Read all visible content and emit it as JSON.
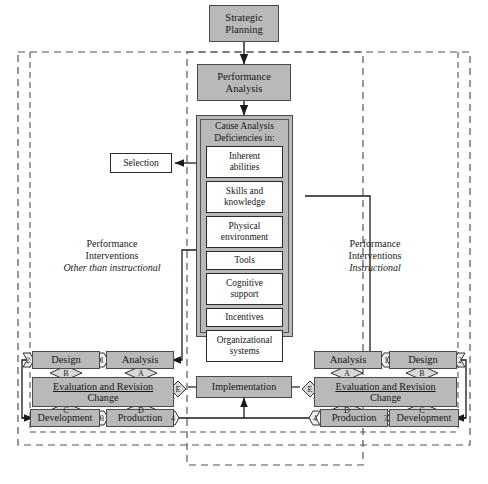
{
  "diagram": {
    "colors": {
      "box_fill": "#b9b9b9",
      "box_border": "#4a4a4a",
      "white_fill": "#ffffff",
      "line": "#1a1a1a",
      "dashed_border": "#555555"
    },
    "top": {
      "strategic_planning": "Strategic\nPlanning",
      "strategic_planning_line1": "Strategic",
      "strategic_planning_line2": "Planning",
      "performance_analysis_line1": "Performance",
      "performance_analysis_line2": "Analysis"
    },
    "cause_analysis": {
      "header_line1": "Cause Analysis",
      "header_line2": "Deficiencies in:",
      "items": [
        {
          "line1": "Inherent",
          "line2": "abilities"
        },
        {
          "line1": "Skills and",
          "line2": "knowledge"
        },
        {
          "line1": "Physical",
          "line2": "environment"
        },
        {
          "line1": "Tools",
          "line2": ""
        },
        {
          "line1": "Cognitive",
          "line2": "support"
        },
        {
          "line1": "Incentives",
          "line2": ""
        },
        {
          "line1": "Organizational",
          "line2": "systems"
        }
      ]
    },
    "selection": {
      "label": "Selection"
    },
    "left_panel": {
      "line1": "Performance",
      "line2": "Interventions",
      "line3": "Other than instructional"
    },
    "right_panel": {
      "line1": "Performance",
      "line2": "Interventions",
      "line3": "Instructional"
    },
    "left_cycle": {
      "design": "Design",
      "analysis": "Analysis",
      "evaluation_line1": "Evaluation and Revision",
      "evaluation_line2": "Change",
      "development": "Development",
      "production": "Production",
      "diamonds": {
        "a": "A",
        "b": "B",
        "c": "C",
        "d": "D",
        "e": "E"
      },
      "connectors": {
        "n1": "1",
        "n2": "2",
        "n3": "3",
        "n4": "4"
      }
    },
    "right_cycle": {
      "analysis": "Analysis",
      "design": "Design",
      "evaluation_line1": "Evaluation and Revision",
      "evaluation_line2": "Change",
      "production": "Production",
      "development": "Development",
      "diamonds": {
        "a": "A",
        "b": "B",
        "c": "C",
        "d": "D",
        "e": "E"
      },
      "connectors": {
        "n1": "1",
        "n2": "2",
        "n3": "3",
        "n4": "4"
      }
    },
    "implementation": {
      "label": "Implementation"
    }
  }
}
